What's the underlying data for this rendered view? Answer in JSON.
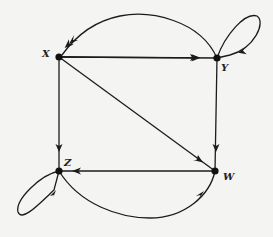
{
  "diagram": {
    "type": "directed-graph",
    "colors": {
      "stroke": "#1c1c1c",
      "background": "#f4f4f2"
    },
    "nodes": [
      {
        "id": "X",
        "label": "X",
        "x": 59,
        "y": 57
      },
      {
        "id": "Y",
        "label": "Y",
        "x": 217,
        "y": 58
      },
      {
        "id": "Z",
        "label": "Z",
        "x": 59,
        "y": 171
      },
      {
        "id": "W",
        "label": "W",
        "x": 215,
        "y": 171
      }
    ],
    "edges": [
      {
        "from": "X",
        "to": "Y",
        "style": "straight"
      },
      {
        "from": "Y",
        "to": "X",
        "style": "arc-over"
      },
      {
        "from": "Y",
        "to": "Y",
        "style": "self-loop"
      },
      {
        "from": "X",
        "to": "Z",
        "style": "straight"
      },
      {
        "from": "X",
        "to": "W",
        "style": "straight-diagonal"
      },
      {
        "from": "Y",
        "to": "W",
        "style": "straight"
      },
      {
        "from": "W",
        "to": "Z",
        "style": "straight"
      },
      {
        "from": "Z",
        "to": "W",
        "style": "arc-under"
      },
      {
        "from": "Z",
        "to": "Z",
        "style": "self-loop"
      }
    ]
  }
}
